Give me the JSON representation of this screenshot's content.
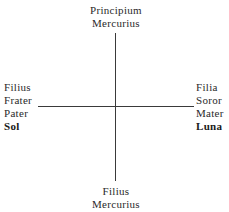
{
  "diagram": {
    "top": [
      "Principium",
      "Mercurius"
    ],
    "bottom": [
      "Filius",
      "Mercurius"
    ],
    "left": [
      "Filius",
      "Frater",
      "Pater",
      "Sol"
    ],
    "right": [
      "Filia",
      "Soror",
      "Mater",
      "Luna"
    ]
  }
}
